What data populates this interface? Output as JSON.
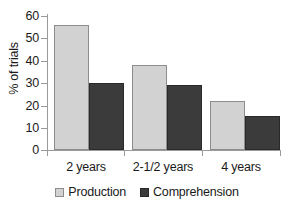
{
  "chart_data": {
    "type": "bar",
    "title": "",
    "xlabel": "",
    "ylabel": "% of trials",
    "categories": [
      "2 years",
      "2-1/2 years",
      "4 years"
    ],
    "series": [
      {
        "name": "Production",
        "values": [
          56,
          38,
          22
        ],
        "color": "#d2d2d2"
      },
      {
        "name": "Comprehension",
        "values": [
          30,
          29,
          15
        ],
        "color": "#3b3b3b"
      }
    ],
    "ylim": [
      0,
      60
    ],
    "yticks": [
      0,
      10,
      20,
      30,
      40,
      50,
      60
    ],
    "ytick_labels": [
      "0",
      "10",
      "20",
      "30",
      "40",
      "50",
      "60"
    ],
    "grid": false,
    "legend_position": "bottom"
  },
  "axes": {
    "y_title": "% of trials",
    "y_tick_labels": [
      "60",
      "50",
      "40",
      "30",
      "20",
      "10",
      "0"
    ],
    "x_tick_labels": [
      "2 years",
      "2-1/2 years",
      "4 years"
    ]
  },
  "legend": {
    "entries": [
      {
        "label": "Production",
        "swatch": "light-gray-square-icon"
      },
      {
        "label": "Comprehension",
        "swatch": "dark-gray-square-icon"
      }
    ]
  }
}
